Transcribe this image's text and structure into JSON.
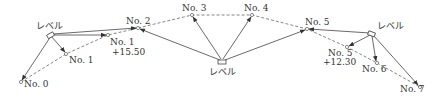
{
  "diagram": {
    "instrument_label": "レベル",
    "points": [
      {
        "id": "no0",
        "label": "No.0",
        "x": 21,
        "y": 82
      },
      {
        "id": "no1",
        "label": "No.1",
        "x": 66,
        "y": 54
      },
      {
        "id": "no1p",
        "label": "No.1",
        "sublabel": "+15.50",
        "x": 108,
        "y": 35
      },
      {
        "id": "no2",
        "label": "No.2",
        "x": 138,
        "y": 28
      },
      {
        "id": "no3",
        "label": "No.3",
        "x": 192,
        "y": 15
      },
      {
        "id": "no4",
        "label": "No.4",
        "x": 252,
        "y": 15
      },
      {
        "id": "no5",
        "label": "No.5",
        "x": 307,
        "y": 29
      },
      {
        "id": "no5p",
        "label": "No.5",
        "sublabel": "+12.30",
        "x": 347,
        "y": 47
      },
      {
        "id": "no6",
        "label": "No.6",
        "x": 377,
        "y": 63
      },
      {
        "id": "no7",
        "label": "No.7",
        "x": 420,
        "y": 87
      }
    ],
    "levels": [
      {
        "id": "lv1",
        "label": "レベル",
        "x": 51,
        "y": 36
      },
      {
        "id": "lv2",
        "label": "レベル",
        "x": 222,
        "y": 62
      },
      {
        "id": "lv3",
        "label": "レベル",
        "x": 372,
        "y": 34
      }
    ],
    "labels": {
      "lv1": "レベル",
      "lv2": "レベル",
      "lv3": "レベル",
      "no0": "No. 0",
      "no1": "No. 1",
      "no1p": "No. 1",
      "no1p_sub": "+15.50",
      "no2": "No. 2",
      "no3": "No. 3",
      "no4": "No. 4",
      "no5": "No. 5",
      "no5p": "No. 5",
      "no5p_sub": "+12.30",
      "no6": "No. 6",
      "no7": "No. 7"
    }
  }
}
